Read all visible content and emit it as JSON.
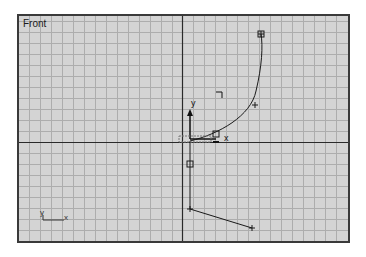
{
  "viewport": {
    "label": "Front",
    "colors": {
      "background": "#d4d4d4",
      "grid": "#a9a9a9",
      "axis": "#2a2a2a",
      "border": "#3a3a3a",
      "spline": "#1a1a1a"
    }
  },
  "gizmo": {
    "y_label": "y",
    "x_label": "x"
  },
  "axis_tripod": {
    "y_label": "y",
    "x_label": "x"
  }
}
